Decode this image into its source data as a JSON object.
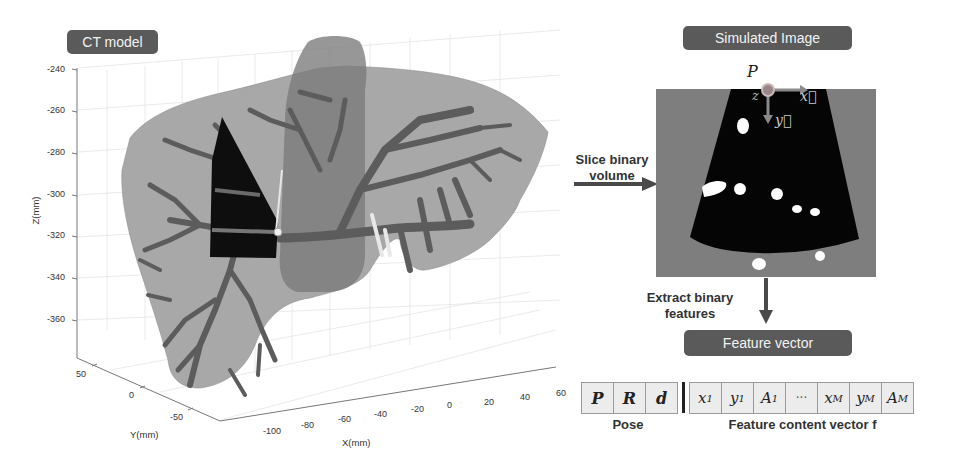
{
  "figure": {
    "left_panel": {
      "title": "CT model",
      "plot": {
        "type": "3d-surface",
        "z_axis": {
          "label": "Z(mm)",
          "ticks": [
            "-240",
            "-260",
            "-280",
            "-300",
            "-320",
            "-340",
            "-360"
          ]
        },
        "y_axis": {
          "label": "Y(mm)",
          "ticks": [
            "50",
            "0",
            "-50"
          ]
        },
        "x_axis": {
          "label": "X(mm)",
          "ticks": [
            "-100",
            "-80",
            "-60",
            "-40",
            "-20",
            "0",
            "20",
            "40",
            "60"
          ]
        },
        "colors": {
          "liver": "#a8a8a8",
          "vessels": "#5e5e5e",
          "slice_plane": "#111111",
          "vena_cava": "#7d7d7d"
        }
      }
    },
    "arrows": {
      "slice": {
        "line1": "Slice binary",
        "line2": "volume"
      },
      "extract": {
        "line1": "Extract binary",
        "line2": "features"
      }
    },
    "right_panel": {
      "title": "Simulated Image",
      "probe_label": "P",
      "axis_labels": {
        "z": "z",
        "x": "x⃗",
        "y": "y⃗"
      },
      "colors": {
        "background": "#7e7e7e",
        "fan": "#050505",
        "features": "#ffffff",
        "probe": "#9a8a8a"
      }
    },
    "feature_vector": {
      "title": "Feature vector",
      "pose_cells": [
        "P",
        "R",
        "d"
      ],
      "content_cells": [
        {
          "base": "x",
          "sub": "1"
        },
        {
          "base": "y",
          "sub": "1"
        },
        {
          "base": "A",
          "sub": "1"
        },
        {
          "base": "···",
          "sub": ""
        },
        {
          "base": "x",
          "sub": "M"
        },
        {
          "base": "y",
          "sub": "M"
        },
        {
          "base": "A",
          "sub": "M"
        }
      ],
      "pose_label": "Pose",
      "content_label": "Feature content vector f"
    }
  }
}
